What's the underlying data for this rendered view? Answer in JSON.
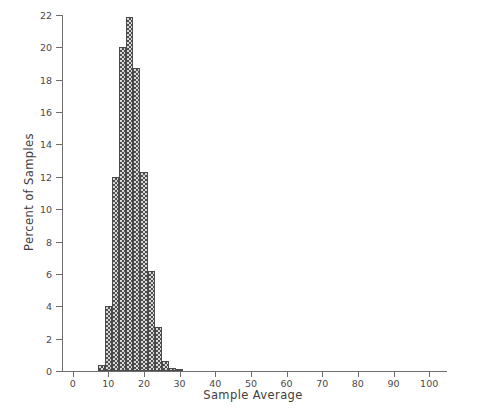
{
  "chart_data": {
    "type": "bar",
    "title": "",
    "xlabel": "Sample Average",
    "ylabel": "Percent of Samples",
    "xlim": [
      -3,
      105
    ],
    "ylim": [
      0,
      22
    ],
    "grid": false,
    "legend": null,
    "bin_width": 2,
    "bin_starts": [
      7,
      9,
      11,
      13,
      15,
      17,
      19,
      21,
      23,
      25,
      27,
      29
    ],
    "categories": [
      "7-9",
      "9-11",
      "11-13",
      "13-15",
      "15-17",
      "17-19",
      "19-21",
      "21-23",
      "23-25",
      "25-27",
      "27-29",
      "29-31"
    ],
    "values": [
      0.35,
      4.0,
      12.0,
      20.0,
      21.9,
      18.7,
      12.3,
      6.2,
      2.7,
      0.6,
      0.2,
      0.1
    ],
    "xticks": [
      0,
      10,
      20,
      30,
      40,
      50,
      60,
      70,
      80,
      90,
      100
    ],
    "xtick_labels": [
      "0",
      "10",
      "20",
      "30",
      "40",
      "50",
      "60",
      "70",
      "80",
      "90",
      "100"
    ],
    "yticks": [
      0,
      2,
      4,
      6,
      8,
      10,
      12,
      14,
      16,
      18,
      20,
      22
    ],
    "ytick_labels": [
      "0",
      "2",
      "4",
      "6",
      "8",
      "10",
      "12",
      "14",
      "16",
      "18",
      "20",
      "22"
    ],
    "colors": {
      "bar_fill": "#d8d8d8",
      "bar_hatch": "#4f4f4f",
      "bar_edge": "#4a4a4a",
      "axis": "#6d6d6d",
      "text": "#3d3d3d",
      "background": "#ffffff"
    }
  }
}
